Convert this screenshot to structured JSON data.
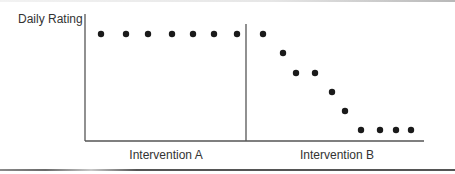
{
  "chart_data": {
    "type": "scatter",
    "title": "",
    "ylabel": "Daily Rating",
    "xlabel": "",
    "phases": [
      {
        "name": "Intervention A",
        "sessions": [
          1,
          2,
          3,
          4,
          5,
          6,
          7
        ],
        "values": [
          6,
          6,
          6,
          6,
          6,
          6,
          6
        ]
      },
      {
        "name": "Intervention B",
        "sessions": [
          8,
          9,
          10,
          11,
          12,
          13,
          14,
          15,
          16,
          17
        ],
        "values": [
          6,
          5,
          4,
          4,
          3,
          2,
          1,
          1,
          1,
          1
        ]
      }
    ],
    "x": [
      1,
      2,
      3,
      4,
      5,
      6,
      7,
      8,
      9,
      10,
      11,
      12,
      13,
      14,
      15,
      16,
      17
    ],
    "values": [
      6,
      6,
      6,
      6,
      6,
      6,
      6,
      6,
      5,
      4,
      4,
      3,
      2,
      1,
      1,
      1,
      1
    ],
    "phase_change_after_session": 7,
    "ylim": [
      0,
      6.5
    ],
    "grid": false,
    "legend": "none",
    "tick_labels": "none"
  },
  "labels": {
    "y_axis": "Daily Rating",
    "phase_a": "Intervention A",
    "phase_b": "Intervention B"
  },
  "points_px": [
    [
      101,
      34
    ],
    [
      126,
      34
    ],
    [
      148,
      34
    ],
    [
      172,
      34
    ],
    [
      193,
      34
    ],
    [
      214,
      34
    ],
    [
      237,
      34
    ],
    [
      263,
      34
    ],
    [
      283,
      53
    ],
    [
      296,
      73
    ],
    [
      315,
      73
    ],
    [
      332,
      92
    ],
    [
      345,
      111
    ],
    [
      361,
      130
    ],
    [
      380,
      130
    ],
    [
      396,
      130
    ],
    [
      411,
      130
    ]
  ]
}
